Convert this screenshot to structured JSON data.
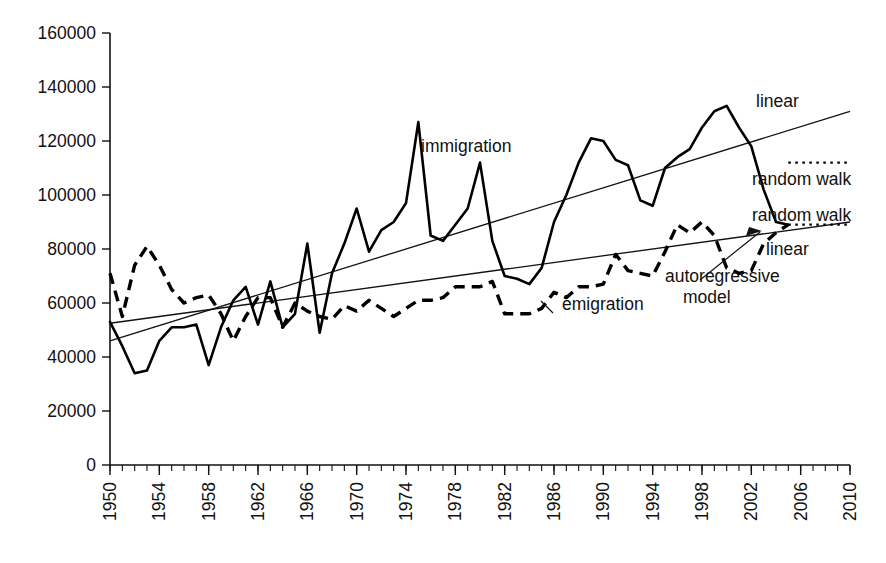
{
  "chart_data": {
    "type": "line",
    "title": "",
    "xlabel": "",
    "ylabel": "",
    "xlim": [
      1950,
      2010
    ],
    "ylim": [
      0,
      160000
    ],
    "grid": false,
    "legend_position": "inline-annotations",
    "y_ticks": [
      0,
      20000,
      40000,
      60000,
      80000,
      100000,
      120000,
      140000,
      160000
    ],
    "y_tick_labels": [
      "0",
      "20000",
      "40000",
      "60000",
      "80000",
      "100000",
      "120000",
      "140000",
      "160000"
    ],
    "x_ticks": [
      1950,
      1954,
      1958,
      1962,
      1966,
      1970,
      1974,
      1978,
      1982,
      1986,
      1990,
      1994,
      1998,
      2002,
      2006,
      2010
    ],
    "x_tick_labels": [
      "1950",
      "1954",
      "1958",
      "1962",
      "1966",
      "1970",
      "1974",
      "1978",
      "1982",
      "1986",
      "1990",
      "1994",
      "1998",
      "2002",
      "2006",
      "2010"
    ],
    "x_minor_tick_interval": 1,
    "series": [
      {
        "name": "immigration",
        "style": "solid",
        "x": [
          1950,
          1951,
          1952,
          1953,
          1954,
          1955,
          1956,
          1957,
          1958,
          1959,
          1960,
          1961,
          1962,
          1963,
          1964,
          1965,
          1966,
          1967,
          1968,
          1969,
          1970,
          1971,
          1972,
          1973,
          1974,
          1975,
          1976,
          1977,
          1978,
          1979,
          1980,
          1981,
          1982,
          1983,
          1984,
          1985,
          1986,
          1987,
          1988,
          1989,
          1990,
          1991,
          1992,
          1993,
          1994,
          1995,
          1996,
          1997,
          1998,
          1999,
          2000,
          2001,
          2002,
          2003,
          2004,
          2005
        ],
        "y": [
          53000,
          44000,
          34000,
          35000,
          46000,
          51000,
          51000,
          52000,
          37000,
          51000,
          61000,
          66000,
          52000,
          68000,
          51000,
          56000,
          82000,
          49000,
          71000,
          82000,
          95000,
          79000,
          87000,
          90000,
          97000,
          127000,
          85000,
          83000,
          89000,
          95000,
          112000,
          83000,
          70000,
          69000,
          67000,
          73000,
          90000,
          100000,
          112000,
          121000,
          120000,
          113000,
          111000,
          98000,
          96000,
          110000,
          114000,
          117000,
          125000,
          131000,
          133000,
          125000,
          118000,
          102000,
          90000,
          89000
        ]
      },
      {
        "name": "emigration",
        "style": "dashed",
        "x": [
          1950,
          1951,
          1952,
          1953,
          1954,
          1955,
          1956,
          1957,
          1958,
          1959,
          1960,
          1961,
          1962,
          1963,
          1964,
          1965,
          1966,
          1967,
          1968,
          1969,
          1970,
          1971,
          1972,
          1973,
          1974,
          1975,
          1976,
          1977,
          1978,
          1979,
          1980,
          1981,
          1982,
          1983,
          1984,
          1985,
          1986,
          1987,
          1988,
          1989,
          1990,
          1991,
          1992,
          1993,
          1994,
          1995,
          1996,
          1997,
          1998,
          1999,
          2000,
          2001,
          2002,
          2003,
          2004,
          2005
        ],
        "y": [
          71000,
          55000,
          74000,
          81000,
          74000,
          65000,
          60000,
          62000,
          63000,
          56000,
          46000,
          55000,
          62000,
          62000,
          51000,
          60000,
          57000,
          55000,
          54000,
          59000,
          57000,
          61000,
          58000,
          55000,
          58000,
          61000,
          61000,
          62000,
          66000,
          66000,
          66000,
          68000,
          56000,
          56000,
          56000,
          58000,
          64000,
          62000,
          66000,
          66000,
          67000,
          78000,
          72000,
          71000,
          70000,
          79000,
          89000,
          86000,
          90000,
          85000,
          73000,
          71000,
          72000,
          82000,
          86000,
          89000
        ]
      }
    ],
    "trend_lines": [
      {
        "name": "immigration linear",
        "label": "linear",
        "x": [
          1950,
          2010
        ],
        "y": [
          46000,
          131000
        ],
        "style": "solid-thin"
      },
      {
        "name": "emigration linear",
        "label": "linear",
        "x": [
          1950,
          2010
        ],
        "y": [
          52500,
          90000
        ],
        "style": "solid-thin"
      }
    ],
    "forecast_lines": [
      {
        "name": "immigration random walk",
        "label": "random walk",
        "x": [
          2005,
          2010
        ],
        "y": [
          112000,
          112000
        ],
        "style": "dotted"
      },
      {
        "name": "emigration random walk",
        "label": "random walk",
        "x": [
          2005,
          2010
        ],
        "y": [
          89000,
          89000
        ],
        "style": "dotted"
      }
    ],
    "annotations": [
      {
        "name": "immigration-label",
        "text": "immigration",
        "x_px": 421,
        "y_px": 152
      },
      {
        "name": "emigration-label",
        "text": "emigration",
        "x_px": 562,
        "y_px": 310
      },
      {
        "name": "linear-upper-label",
        "text": "linear",
        "x_px": 756,
        "y_px": 107
      },
      {
        "name": "random-walk-upper-label",
        "text": "random walk",
        "x_px": 752,
        "y_px": 185
      },
      {
        "name": "random-walk-lower-label",
        "text": "random walk",
        "x_px": 752,
        "y_px": 221
      },
      {
        "name": "linear-lower-label",
        "text": "linear",
        "x_px": 766,
        "y_px": 255
      },
      {
        "name": "autoregressive-label-line1",
        "text": "autoregressive",
        "x_px": 665,
        "y_px": 282
      },
      {
        "name": "autoregressive-label-line2",
        "text": "model",
        "x_px": 683,
        "y_px": 303
      }
    ]
  },
  "colors": {
    "background": "#ffffff",
    "ink": "#000000",
    "axis": "#111111"
  }
}
